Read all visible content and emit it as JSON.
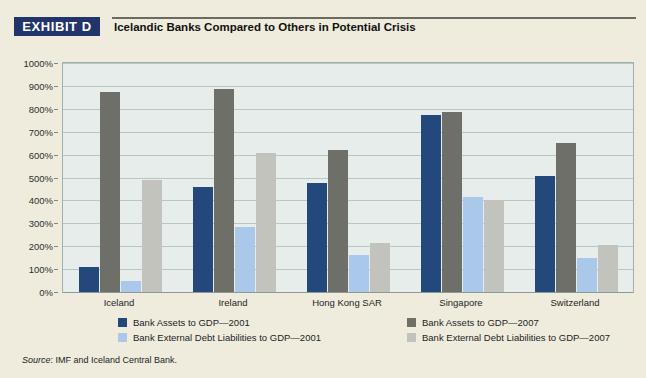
{
  "header": {
    "exhibit_badge": "EXHIBIT D",
    "title": "Icelandic Banks Compared to Others in Potential Crisis"
  },
  "source": {
    "label": "Source",
    "text": ": IMF and Iceland Central Bank."
  },
  "colors": {
    "series_0": "#23487c",
    "series_1": "#6f6f69",
    "series_2": "#aac9ea",
    "series_3": "#c3c3be",
    "badge": "#22356b",
    "page_background": "#efecdd",
    "plot_background": "#e7edea",
    "gridline": "#b9c7c2"
  },
  "chart_data": {
    "type": "bar",
    "title": "Icelandic Banks Compared to Others in Potential Crisis",
    "xlabel": "",
    "ylabel": "",
    "ylim": [
      0,
      1000
    ],
    "ytick_values": [
      0,
      100,
      200,
      300,
      400,
      500,
      600,
      700,
      800,
      900,
      1000
    ],
    "ytick_labels": [
      "0%",
      "100%",
      "200%",
      "300%",
      "400%",
      "500%",
      "600%",
      "700%",
      "800%",
      "900%",
      "1000%"
    ],
    "grid": true,
    "legend_position": "bottom",
    "categories": [
      "Iceland",
      "Ireland",
      "Hong Kong SAR",
      "Singapore",
      "Switzerland"
    ],
    "series": [
      {
        "name": "Bank Assets to GDP—2001",
        "color": "#23487c",
        "values": [
          110,
          460,
          475,
          775,
          505
        ]
      },
      {
        "name": "Bank Assets to GDP—2007",
        "color": "#6f6f69",
        "values": [
          875,
          885,
          620,
          785,
          650
        ]
      },
      {
        "name": "Bank External Debt Liabilities to GDP—2001",
        "color": "#aac9ea",
        "values": [
          50,
          285,
          160,
          415,
          150
        ]
      },
      {
        "name": "Bank External Debt Liabilities to GDP—2007",
        "color": "#c3c3be",
        "values": [
          490,
          605,
          215,
          400,
          205
        ]
      }
    ]
  }
}
